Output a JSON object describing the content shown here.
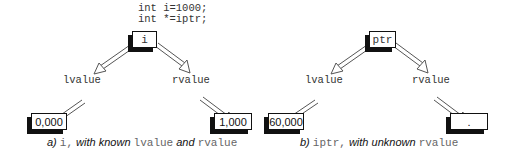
{
  "diagram_a": {
    "code_lines": [
      "int i=1000;",
      "int *=iptr;"
    ],
    "root_label": "i",
    "left_edge_label": "lvalue",
    "right_edge_label": "rvalue",
    "left_leaf_value": "0,000",
    "right_leaf_value": "1,000",
    "caption": {
      "prefix": "a) ",
      "var": "i,",
      "mid1": " with known ",
      "term1": "lvalue",
      "mid2": " and ",
      "term2": "rvalue"
    }
  },
  "diagram_b": {
    "root_label": "ptr",
    "left_edge_label": "lvalue",
    "right_edge_label": "rvalue",
    "left_leaf_value": "60,000",
    "right_leaf_value": ".",
    "caption": {
      "prefix": "b) ",
      "var": "iptr,",
      "mid1": " with unknown ",
      "term1": "rvalue"
    }
  }
}
